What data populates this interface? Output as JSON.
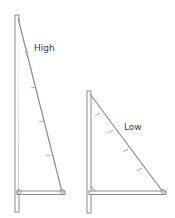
{
  "diagram": {
    "type": "sail-aspect-ratio-comparison",
    "colors": {
      "line": "#8c8c8c",
      "mast_fill": "#ffffff",
      "text": "#3a3a3a"
    },
    "sails": [
      {
        "id": "high",
        "label": "High",
        "mast": {
          "x": 15,
          "y_top": 15,
          "y_bottom": 212,
          "width": 4
        },
        "head": [
          18,
          18
        ],
        "tack": [
          19,
          193
        ],
        "clew": [
          62,
          193
        ],
        "boom": {
          "x1": 17,
          "x2": 65,
          "y": 193
        },
        "leech_ticks": 4,
        "label_pos": [
          34,
          43
        ]
      },
      {
        "id": "low",
        "label": "Low",
        "mast": {
          "x": 87,
          "y_top": 91,
          "y_bottom": 213,
          "width": 4
        },
        "head": [
          90,
          94
        ],
        "tack": [
          90,
          193
        ],
        "clew": [
          163,
          193
        ],
        "boom": {
          "x1": 89,
          "x2": 166,
          "y": 193
        },
        "leech_ticks": 4,
        "label_pos": [
          125,
          122
        ]
      }
    ]
  }
}
